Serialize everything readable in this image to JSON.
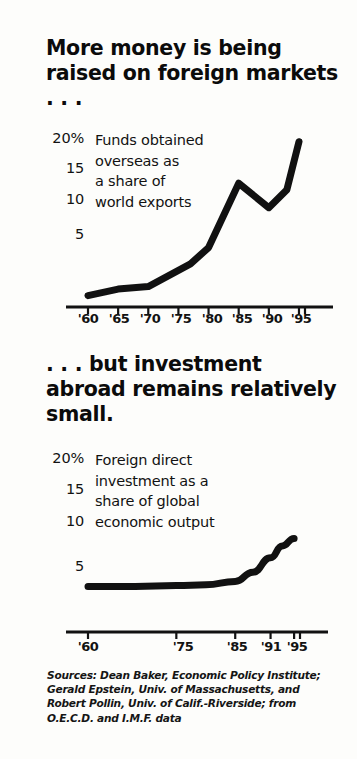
{
  "document": {
    "type": "newspaper-infographic",
    "background_color": "#fdfdfb",
    "ink_color": "#111111"
  },
  "panel_one": {
    "headline": "More money is being raised on foreign markets . . .",
    "annotation": "Funds obtained\noverseas as\na share of\nworld exports",
    "y_tick_labels": [
      "20%",
      "15",
      "10",
      "5"
    ],
    "x_tick_labels": [
      "'60",
      "'65",
      "'70",
      "'75",
      "'80",
      "'85",
      "'90",
      "'95"
    ]
  },
  "panel_two": {
    "headline": ". . . but investment abroad remains relatively small.",
    "annotation": "Foreign direct\ninvestment as a\nshare of global\neconomic output",
    "y_tick_labels": [
      "20%",
      "15",
      "10",
      "5"
    ],
    "x_tick_labels": [
      "'60",
      "'75",
      "'85",
      "'91",
      "'95"
    ]
  },
  "sources": {
    "text": "Sources: Dean Baker, Economic Policy Institute; Gerald Epstein, Univ. of Massachusetts, and Robert Pollin, Univ. of Calif.-Riverside; from O.E.C.D. and I.M.F. data"
  },
  "chart_data": [
    {
      "id": "funds-obtained-overseas",
      "type": "line",
      "title": "More money is being raised on foreign markets . . .",
      "subtitle": "Funds obtained overseas as a share of world exports",
      "xlabel": "",
      "ylabel": "Percent",
      "xlim": [
        1960,
        1996
      ],
      "ylim": [
        0,
        21
      ],
      "grid": false,
      "legend": "none",
      "line_color": "#111111",
      "line_width": 7,
      "x_ticks": [
        1960,
        1965,
        1970,
        1975,
        1980,
        1985,
        1990,
        1995
      ],
      "x_tick_labels": [
        "'60",
        "'65",
        "'70",
        "'75",
        "'80",
        "'85",
        "'90",
        "'95"
      ],
      "y_ticks": [
        5,
        10,
        15,
        20
      ],
      "y_tick_labels": [
        "5",
        "10",
        "15",
        "20%"
      ],
      "x": [
        1960,
        1965,
        1970,
        1977,
        1980,
        1985,
        1990,
        1993,
        1995
      ],
      "values": [
        1.4,
        2.2,
        2.5,
        5.3,
        7.3,
        15.2,
        12.2,
        14.4,
        20.3
      ]
    },
    {
      "id": "foreign-direct-investment",
      "type": "line",
      "title": ". . . but investment abroad remains relatively small.",
      "subtitle": "Foreign direct investment as a share of global economic output",
      "xlabel": "",
      "ylabel": "Percent",
      "xlim": [
        1960,
        1996
      ],
      "ylim": [
        0,
        21
      ],
      "grid": false,
      "legend": "none",
      "line_color": "#111111",
      "line_width": 7,
      "x_ticks": [
        1960,
        1975,
        1985,
        1991,
        1995
      ],
      "x_tick_labels": [
        "'60",
        "'75",
        "'85",
        "'91",
        "'95"
      ],
      "y_ticks": [
        5,
        10,
        15,
        20
      ],
      "y_tick_labels": [
        "5",
        "10",
        "15",
        "20%"
      ],
      "x": [
        1960,
        1968,
        1975,
        1980,
        1985,
        1988,
        1991,
        1993,
        1995
      ],
      "values": [
        5.4,
        5.4,
        5.5,
        5.6,
        6.0,
        7.1,
        8.8,
        10.2,
        11.1
      ]
    }
  ]
}
